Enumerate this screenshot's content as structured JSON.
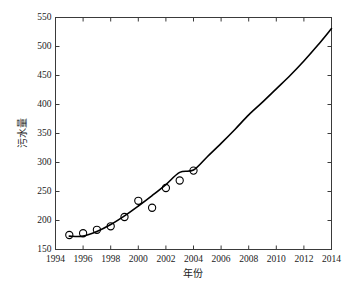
{
  "chart_data": {
    "type": "scatter",
    "title": "",
    "xlabel": "年份",
    "ylabel": "污水量",
    "xlim": [
      1994,
      2014
    ],
    "ylim": [
      150,
      550
    ],
    "xticks": [
      1994,
      1996,
      1998,
      2000,
      2002,
      2004,
      2006,
      2008,
      2010,
      2012,
      2014
    ],
    "yticks": [
      150,
      200,
      250,
      300,
      350,
      400,
      450,
      500,
      550
    ],
    "grid": false,
    "legend": null,
    "series": [
      {
        "name": "观测值",
        "type": "scatter",
        "marker": "open-circle",
        "color": "#000000",
        "x": [
          1995,
          1996,
          1997,
          1998,
          1999,
          2000,
          2001,
          2002,
          2003,
          2004
        ],
        "values": [
          175,
          178,
          184,
          190,
          206,
          234,
          222,
          256,
          269,
          286
        ]
      },
      {
        "name": "拟合曲线",
        "type": "line",
        "color": "#000000",
        "x": [
          1995,
          1996,
          1997,
          1998,
          1999,
          2000,
          2001,
          2002,
          2003,
          2004,
          2005,
          2006,
          2007,
          2008,
          2009,
          2010,
          2011,
          2012,
          2013,
          2014
        ],
        "values": [
          173,
          173,
          181,
          193,
          208,
          225,
          243,
          262,
          283,
          287,
          310,
          333,
          357,
          382,
          404,
          427,
          450,
          475,
          502,
          531
        ]
      }
    ]
  },
  "axis": {
    "x_title": "年份",
    "y_title": "污水量",
    "x_tick_labels": [
      "1994",
      "1996",
      "1998",
      "2000",
      "2002",
      "2004",
      "2006",
      "2008",
      "2010",
      "2012",
      "2014"
    ],
    "y_tick_labels": [
      "550",
      "500",
      "450",
      "400",
      "350",
      "300",
      "250",
      "200",
      "150"
    ]
  },
  "style": {
    "line_color": "#000000",
    "marker_color": "#000000",
    "axis_color": "#3a3a3a",
    "background": "#ffffff"
  }
}
